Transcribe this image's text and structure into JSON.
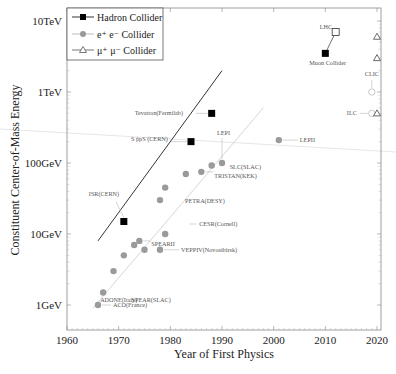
{
  "chart_data": {
    "type": "scatter",
    "title": "",
    "xlabel": "Year of First Physics",
    "ylabel": "Constituent Center-of-Mass Energy",
    "xlim": [
      1959,
      2021
    ],
    "ylim_gev": [
      0.6,
      16000
    ],
    "yscale": "log",
    "grid": false,
    "legend_position": "upper left",
    "x_ticks": [
      1960,
      1970,
      1980,
      1990,
      2000,
      2010,
      2020
    ],
    "x_tick_labels": [
      "1960",
      "1970",
      "1980",
      "1990",
      "2000",
      "2010",
      "2020"
    ],
    "y_ticks_gev": [
      1,
      10,
      100,
      1000,
      10000
    ],
    "y_tick_labels": [
      "1GeV",
      "10GeV",
      "100GeV",
      "1TeV",
      "10TeV"
    ],
    "legend": [
      {
        "name": "Hadron Collider",
        "marker": "filled-square",
        "color": "#000000"
      },
      {
        "name": "e⁺ e⁻  Collider",
        "marker": "filled-circle",
        "color": "#999999"
      },
      {
        "name": "μ⁺ μ⁻  Collider",
        "marker": "open-triangle",
        "color": "#555555"
      }
    ],
    "series": [
      {
        "name": "Hadron Collider",
        "points": [
          {
            "label": "ISR(CERN)",
            "x": 1971,
            "y": 15
          },
          {
            "label": "S p̄pS  (CERN)",
            "x": 1984,
            "y": 200
          },
          {
            "label": "Tevatron(Fermilab)",
            "x": 1988,
            "y": 500
          },
          {
            "label": "Muon Collider",
            "x": 2010,
            "y": 3500
          },
          {
            "label": "LHC",
            "x": 2012,
            "y": 7000,
            "open": true
          }
        ]
      },
      {
        "name": "e+e- Collider",
        "points": [
          {
            "label": "ACO(France)",
            "x": 1966,
            "y": 1.0
          },
          {
            "label": "ADONE(Italy)",
            "x": 1967,
            "y": 1.5
          },
          {
            "label": "SPEAR(SLAC)",
            "x": 1969,
            "y": 3
          },
          {
            "label": "",
            "x": 1971,
            "y": 5
          },
          {
            "label": "SPEARII",
            "x": 1974,
            "y": 8
          },
          {
            "label": "",
            "x": 1973,
            "y": 7
          },
          {
            "label": "",
            "x": 1975,
            "y": 6
          },
          {
            "label": "VEPPIV(Novosibirsk)",
            "x": 1978,
            "y": 6
          },
          {
            "label": "CESR(Cornell)",
            "x": 1979,
            "y": 10
          },
          {
            "label": "PETRA(DESY)",
            "x": 1978,
            "y": 30
          },
          {
            "label": "",
            "x": 1979,
            "y": 45
          },
          {
            "label": "",
            "x": 1983,
            "y": 70
          },
          {
            "label": "TRISTAN(KEK)",
            "x": 1986,
            "y": 75
          },
          {
            "label": "SLC(SLAC)",
            "x": 1988,
            "y": 92
          },
          {
            "label": "LEPI",
            "x": 1990,
            "y": 100
          },
          {
            "label": "LEPII",
            "x": 2001,
            "y": 210
          },
          {
            "label": "ILC",
            "x": 2019,
            "y": 500,
            "open": true
          },
          {
            "label": "CLIC",
            "x": 2019,
            "y": 1000,
            "open": true
          }
        ]
      },
      {
        "name": "mu+mu- Collider",
        "points": [
          {
            "label": "",
            "x": 2020,
            "y": 500
          },
          {
            "label": "",
            "x": 2020,
            "y": 3000
          },
          {
            "label": "",
            "x": 2020,
            "y": 6000
          }
        ]
      }
    ],
    "trend_lines": [
      {
        "name": "hadron-trend",
        "from": {
          "x": 1966,
          "y": 8
        },
        "to": {
          "x": 1990,
          "y": 2000
        },
        "color": "#000000"
      },
      {
        "name": "ee-trend",
        "from": {
          "x": 1965,
          "y": 0.9
        },
        "to": {
          "x": 1998,
          "y": 600
        },
        "color": "#cccccc"
      }
    ]
  }
}
